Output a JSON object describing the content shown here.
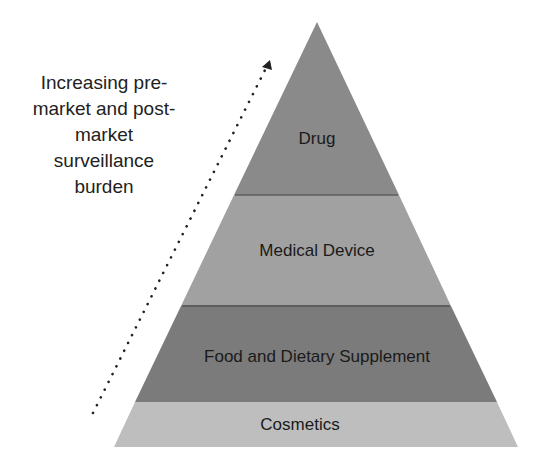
{
  "diagram": {
    "type": "pyramid",
    "side_annotation": {
      "lines": [
        "Increasing pre-",
        "market and post-",
        "market",
        "surveillance",
        "burden"
      ],
      "arrow": "dotted-arrow-up-right"
    },
    "tiers": [
      {
        "label": "Drug",
        "color": "#8a8a8a"
      },
      {
        "label": "Medical Device",
        "color": "#a1a1a1"
      },
      {
        "label": "Food and Dietary Supplement",
        "color": "#7b7b7b"
      },
      {
        "label": "Cosmetics",
        "color": "#bebebe"
      }
    ],
    "divider_color": "#5a5a5a"
  }
}
